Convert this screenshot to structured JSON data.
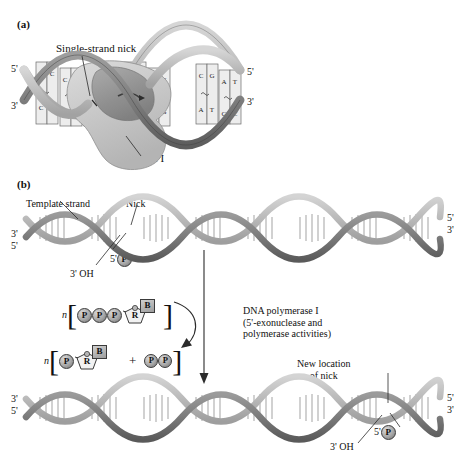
{
  "figure": {
    "panel_a": {
      "tag": "(a)",
      "labels": {
        "nick": "Single-strand nick",
        "enzyme": "Pol I",
        "left_top": "5'",
        "left_bottom": "3'",
        "right_top": "5'",
        "right_bottom": "3'"
      },
      "base_pairs": [
        "G-C",
        "C-G",
        "T-A",
        "A-T",
        "A-T",
        "T-A",
        "C-G",
        "A-T",
        "G-C",
        "C-G",
        "A-T",
        "T-A",
        "G-C"
      ]
    },
    "panel_b": {
      "tag": "(b)",
      "top_strand": {
        "template_label": "Template strand",
        "nick_label": "Nick",
        "phosphate_label": "5'",
        "phosphate_token": "P",
        "hydroxyl_label": "3' OH",
        "left_top": "3'",
        "left_bottom": "5'",
        "right_top": "5'",
        "right_bottom": "3'"
      },
      "reaction": {
        "enzyme_line_1": "DNA polymerase I",
        "enzyme_line_2": "(5'-exonuclease and",
        "enzyme_line_3": "polymerase activities)",
        "substrate": {
          "coefficient": "n",
          "phosphates": [
            "P",
            "P",
            "P"
          ],
          "sugar": "R",
          "base": "B"
        },
        "product": {
          "coefficient": "n",
          "phosphates": [
            "P"
          ],
          "sugar": "R",
          "base": "B",
          "plus": "+",
          "pyrophosphate": [
            "P",
            "P"
          ]
        }
      },
      "bottom_strand": {
        "new_nick_line_1": "New location",
        "new_nick_line_2": "of nick",
        "phosphate_label": "5'",
        "phosphate_token": "P",
        "hydroxyl_label": "3' OH",
        "left_top": "3'",
        "left_bottom": "5'",
        "right_top": "5'",
        "right_bottom": "3'"
      }
    }
  },
  "colors": {
    "ribbon_dark": "#6e6e6e",
    "ribbon_light": "#b9b9b9",
    "rung": "#8a8a8a",
    "protein": "#cfcfcf",
    "protein_dark": "#9a9a9a",
    "ink": "#111111"
  }
}
